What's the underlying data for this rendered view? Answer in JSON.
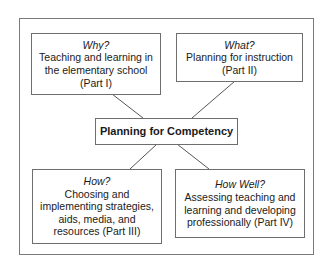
{
  "diagram": {
    "center": {
      "label": "Planning for Competency"
    },
    "boxes": [
      {
        "id": "why",
        "question": "Why?",
        "lines": [
          "Teaching and learning in",
          "the elementary school",
          "(Part I)"
        ]
      },
      {
        "id": "what",
        "question": "What?",
        "lines": [
          "Planning for instruction",
          "(Part II)"
        ]
      },
      {
        "id": "how",
        "question": "How?",
        "lines": [
          "Choosing and",
          "implementing strategies,",
          "aids, media, and",
          "resources (Part III)"
        ]
      },
      {
        "id": "how-well",
        "question": "How Well?",
        "lines": [
          "Assessing teaching and",
          "learning and developing",
          "professionally (Part IV)"
        ]
      }
    ],
    "colors": {
      "border": "#6e6e6e",
      "frame": "#7a7a7a",
      "text": "#1a1a1a",
      "background": "#ffffff"
    }
  }
}
